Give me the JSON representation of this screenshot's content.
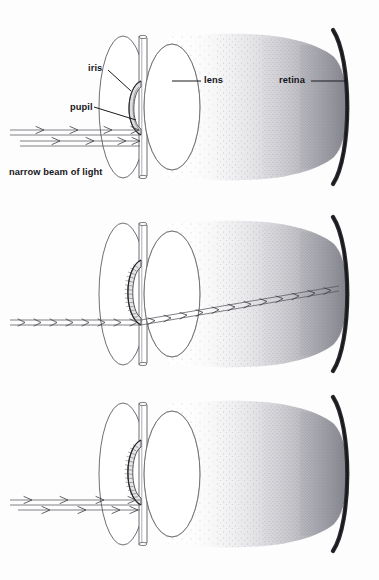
{
  "figure": {
    "width": 379,
    "height": 580,
    "background_color": "#fdfdfd",
    "ink_color": "#1b1b20",
    "outline_color": "#4a4a50",
    "retina_color": "#2b2b30",
    "vitreous_stipple_color": "#70707a"
  },
  "labels": {
    "iris": "iris",
    "pupil": "pupil",
    "lens": "lens",
    "retina": "retina",
    "beam": "narrow beam of light"
  },
  "panels": [
    {
      "id": "panel-top",
      "index": 1,
      "y_top": 25,
      "y_bottom": 205,
      "pupil_state": "dilated",
      "beam_state": "entering, blocked at pupil plane",
      "beam_reaches_retina": false,
      "labelled": true,
      "labels_shown": [
        "iris",
        "pupil",
        "lens",
        "retina",
        "narrow beam of light"
      ],
      "arrow_rows": 3,
      "chevrons_per_row": 4
    },
    {
      "id": "panel-middle",
      "index": 2,
      "y_top": 212,
      "y_bottom": 388,
      "pupil_state": "constricted with striations",
      "beam_state": "passes through pupil, refracts upward through lens to retina",
      "beam_reaches_retina": true,
      "labelled": false,
      "labels_shown": [],
      "arrow_rows": 1,
      "chevrons_per_row": 22
    },
    {
      "id": "panel-bottom",
      "index": 3,
      "y_top": 392,
      "y_bottom": 568,
      "pupil_state": "constricted with striations",
      "beam_state": "stopped at the iris, does not enter",
      "beam_reaches_retina": false,
      "labelled": false,
      "labels_shown": [],
      "arrow_rows": 2,
      "chevrons_per_row": 4
    }
  ],
  "structures": [
    {
      "name": "iris",
      "描述": "",
      "shape": "large vertical ellipse seen obliquely with thin edge-on band"
    },
    {
      "name": "pupil",
      "shape": "small crescent aperture at centre of iris"
    },
    {
      "name": "lens",
      "shape": "vertical ellipse behind the iris"
    },
    {
      "name": "retina",
      "shape": "dark curved arc forming the right boundary"
    },
    {
      "name": "vitreous",
      "shape": "stippled region between lens and retina"
    }
  ]
}
